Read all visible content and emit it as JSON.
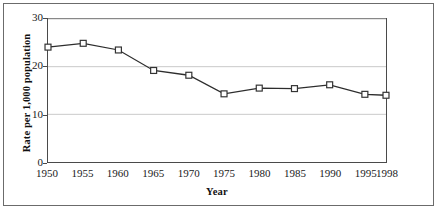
{
  "chart_data": {
    "type": "line",
    "title": "",
    "xlabel": "Year",
    "ylabel": "Rate per 1,000 population",
    "categories": [
      "1950",
      "1955",
      "1960",
      "1965",
      "1970",
      "1975",
      "1980",
      "1985",
      "1990",
      "1995",
      "1998"
    ],
    "x": [
      1950,
      1955,
      1960,
      1965,
      1970,
      1975,
      1980,
      1985,
      1990,
      1995,
      1998
    ],
    "values": [
      24.1,
      24.9,
      23.5,
      19.2,
      18.2,
      14.3,
      15.5,
      15.4,
      16.2,
      14.2,
      14.0
    ],
    "series": [
      {
        "name": "Rate per 1,000 population",
        "values": [
          24.1,
          24.9,
          23.5,
          19.2,
          18.2,
          14.3,
          15.5,
          15.4,
          16.2,
          14.2,
          14.0
        ]
      }
    ],
    "xtick_labels": [
      "1950",
      "1955",
      "1960",
      "1965",
      "1970",
      "1975",
      "1980",
      "1985",
      "1990",
      "1995",
      "1998"
    ],
    "ytick_labels": [
      "0",
      "10",
      "20",
      "30"
    ],
    "yticks": [
      0,
      10,
      20,
      30
    ],
    "ylim": [
      0,
      30
    ],
    "xlim": [
      1950,
      1998
    ],
    "grid": "horizontal",
    "legend": "none",
    "marker": "open-square",
    "line_color": "#2d2d2d",
    "marker_fill": "#ffffff",
    "marker_stroke": "#333333",
    "gridline_color": "#c9c9c9",
    "axis_color": "#4a4a4a",
    "border_color": "#6b6b6b",
    "background": "#ffffff"
  }
}
